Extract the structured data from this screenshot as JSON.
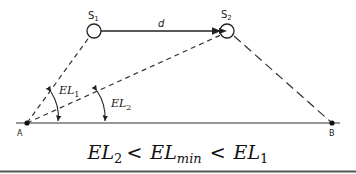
{
  "diagram": {
    "satellites": [
      {
        "label": "S",
        "sub": "1"
      },
      {
        "label": "S",
        "sub": "2"
      }
    ],
    "distance_label": "d",
    "points": [
      {
        "label": "A"
      },
      {
        "label": "B"
      }
    ],
    "angles": [
      {
        "label": "EL",
        "sub": "1"
      },
      {
        "label": "EL",
        "sub": "2"
      }
    ],
    "formula": {
      "parts": [
        {
          "text": "EL",
          "sub": "2"
        },
        {
          "op": "<"
        },
        {
          "text": "EL",
          "sub": "min"
        },
        {
          "op": "<"
        },
        {
          "text": "EL",
          "sub": "1"
        }
      ]
    },
    "colors": {
      "line": "#222222",
      "bottom_rule": "#555555"
    }
  }
}
